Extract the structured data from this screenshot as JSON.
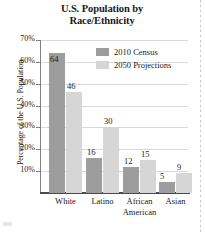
{
  "chart_data": {
    "type": "bar",
    "title": "U.S. Population by Race/Ethnicity",
    "title_lines": [
      "U.S. Population by",
      "Race/Ethnicity"
    ],
    "xlabel": "",
    "ylabel": "Percentage of the U.S. Population",
    "categories": [
      "White",
      "Latino",
      "African American",
      "Asian"
    ],
    "category_lines": [
      [
        "White",
        ""
      ],
      [
        "Latino",
        ""
      ],
      [
        "African",
        "American"
      ],
      [
        "Asian",
        ""
      ]
    ],
    "series": [
      {
        "name": "2010 Census",
        "color": "#9d9d9d",
        "values": [
          64,
          16,
          12,
          5
        ]
      },
      {
        "name": "2050 Projections",
        "color": "#d6d6d6",
        "values": [
          46,
          30,
          15,
          9
        ]
      }
    ],
    "ylim": [
      0,
      70
    ],
    "yticks": [
      10,
      20,
      30,
      40,
      50,
      60,
      70
    ],
    "ytick_labels": [
      "10%",
      "20%",
      "30%",
      "40%",
      "50%",
      "60%",
      "70%"
    ],
    "grid": true,
    "legend_position": "top-right",
    "value_labels": true
  }
}
